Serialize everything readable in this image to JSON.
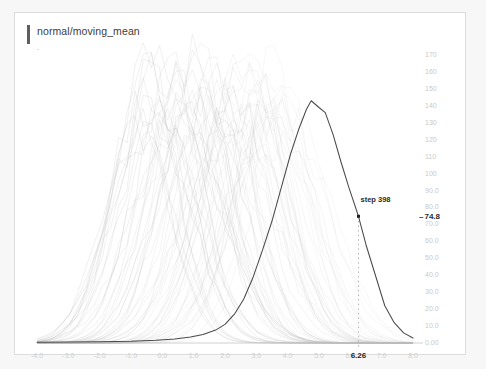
{
  "card": {
    "title": "normal/moving_mean",
    "subtitle_marker": "."
  },
  "hover": {
    "step_label": "step 398",
    "y_value_label": "74.8",
    "y_value_dash": "–",
    "x_value_label": "6.26"
  },
  "colors": {
    "card_background": "#ffffff",
    "page_background": "#f7f7f7",
    "card_border": "#dcdcdc",
    "title_accent": "#5f5f5f",
    "title_text": "#3c3c3c",
    "tick_text": "#c9c9c9",
    "highlight_curve": "#4a4a4a",
    "faint_curve": "#b9b9b9",
    "crosshair": "#b0b0b0",
    "hover_text": "#2a2a2a"
  },
  "chart_data": {
    "type": "line",
    "title": "normal/moving_mean",
    "xlabel": "",
    "ylabel": "",
    "grid": false,
    "legend": "none",
    "xlim": [
      -4.0,
      8.0
    ],
    "ylim": [
      0.0,
      170.0
    ],
    "x_ticks": [
      "-4.0",
      "-3.0",
      "-2.0",
      "-1.0",
      "0.0",
      "1.0",
      "2.0",
      "3.0",
      "4.0",
      "5.0",
      "6.0",
      "7.0",
      "8.0"
    ],
    "x_tick_values": [
      -4.0,
      -3.0,
      -2.0,
      -1.0,
      0.0,
      1.0,
      2.0,
      3.0,
      4.0,
      5.0,
      6.0,
      7.0,
      8.0
    ],
    "y_ticks": [
      "170",
      "160",
      "150",
      "140",
      "130",
      "120",
      "110",
      "100",
      "90.0",
      "80.0",
      "70.0",
      "60.0",
      "50.0",
      "40.0",
      "30.0",
      "20.0",
      "10.0",
      "0.00"
    ],
    "y_tick_values": [
      170,
      160,
      150,
      140,
      130,
      120,
      110,
      100,
      90,
      80,
      70,
      60,
      50,
      40,
      30,
      20,
      10,
      0
    ],
    "annotations": [
      {
        "text": "step 398",
        "x": 6.26,
        "y": 74.8
      },
      {
        "text": "74.8",
        "axis": "y",
        "value": 74.8
      },
      {
        "text": "6.26",
        "axis": "x",
        "value": 6.26
      }
    ],
    "highlighted_series": {
      "name": "step 398",
      "color": "#4a4a4a",
      "x": [
        -4.0,
        -2.0,
        -1.0,
        -0.2,
        0.4,
        0.9,
        1.3,
        1.7,
        2.0,
        2.3,
        2.6,
        2.9,
        3.2,
        3.5,
        3.8,
        4.1,
        4.35,
        4.6,
        4.75,
        5.0,
        5.2,
        5.45,
        5.7,
        5.95,
        6.26,
        6.5,
        6.8,
        7.1,
        7.4,
        7.7,
        8.0
      ],
      "y": [
        0.5,
        0.7,
        1.0,
        1.6,
        2.4,
        3.5,
        5.0,
        7.6,
        11.0,
        17.0,
        26.0,
        39.0,
        55.0,
        72.0,
        92.0,
        112.0,
        126.0,
        138.0,
        143.0,
        139.0,
        136.0,
        123.0,
        107.0,
        92.0,
        74.8,
        58.0,
        40.0,
        22.0,
        12.0,
        6.0,
        3.0
      ]
    },
    "background_series_count": 60,
    "background_series_description": "Dense overlay of ~60 faint light-gray density/histogram curves from earlier steps, peaks migrating left-to-right from about x=-0.6 to x=4.0 with peak heights between 120 and 172."
  }
}
